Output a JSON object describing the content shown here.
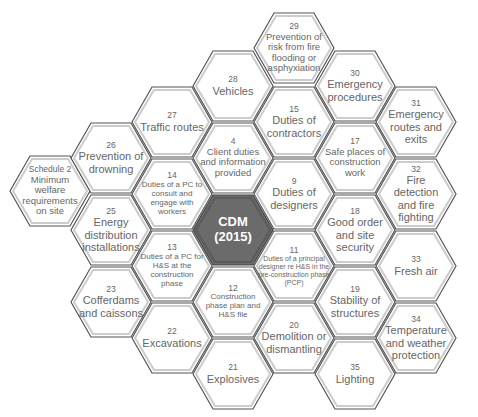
{
  "center": {
    "line1": "CDM",
    "line2": "(2015)",
    "fill": "#6b6b6b"
  },
  "hexes": [
    {
      "num": "Schedule 2",
      "label": "Minimum welfare requirements on site"
    },
    {
      "num": "26",
      "label": "Prevention of drowning"
    },
    {
      "num": "25",
      "label": "Energy distribution installations"
    },
    {
      "num": "23",
      "label": "Cofferdams and caissons"
    },
    {
      "num": "27",
      "label": "Traffic routes"
    },
    {
      "num": "14",
      "label": "Duties of a PC to consult and engage with workers"
    },
    {
      "num": "13",
      "label": "Duties of a PC for H&S at the construction phase"
    },
    {
      "num": "22",
      "label": "Excavations"
    },
    {
      "num": "28",
      "label": "Vehicles"
    },
    {
      "num": "4",
      "label": "Client duties and information provided"
    },
    {
      "num": "12",
      "label": "Construction phase plan and H&S file"
    },
    {
      "num": "21",
      "label": "Explosives"
    },
    {
      "num": "29",
      "label": "Prevention of risk from fire flooding or asphyxiation"
    },
    {
      "num": "15",
      "label": "Duties of contractors"
    },
    {
      "num": "9",
      "label": "Duties of designers"
    },
    {
      "num": "11",
      "label": "Duties of a principal designer re H&S in the pre-construction phase (PCP)"
    },
    {
      "num": "20",
      "label": "Demolition or dismantling"
    },
    {
      "num": "30",
      "label": "Emergency procedures"
    },
    {
      "num": "17",
      "label": "Safe places of construction work"
    },
    {
      "num": "18",
      "label": "Good order and site security"
    },
    {
      "num": "19",
      "label": "Stability of structures"
    },
    {
      "num": "35",
      "label": "Lighting"
    },
    {
      "num": "31",
      "label": "Emergency routes and exits"
    },
    {
      "num": "32",
      "label": "Fire detection and fire fighting"
    },
    {
      "num": "33",
      "label": "Fresh air"
    },
    {
      "num": "34",
      "label": "Temperature and weather protection"
    }
  ],
  "colors": {
    "hex_fill": "#ffffff",
    "hex_stroke": "#555555",
    "text": "#666666",
    "center_fill": "#6b6b6b"
  }
}
